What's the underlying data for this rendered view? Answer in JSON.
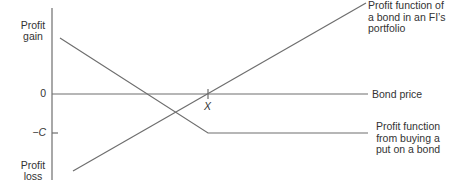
{
  "diagram": {
    "type": "payoff-diagram",
    "y_axis": {
      "top_label_line1": "Profit",
      "top_label_line2": "gain",
      "bottom_label_line1": "Profit",
      "bottom_label_line2": "loss",
      "ticks": [
        {
          "label": "0",
          "position": "origin"
        },
        {
          "label": "−C",
          "position": "put premium"
        }
      ]
    },
    "x_axis": {
      "label": "Bond price",
      "tick_label": "X"
    },
    "lines": [
      {
        "name": "bond-profit",
        "label_line1": "Profit function of",
        "label_line2": "a bond in an FI’s",
        "label_line3": "portfolio",
        "shape": "upward sloping straight line"
      },
      {
        "name": "put-profit",
        "label_line1": "Profit function",
        "label_line2": "from buying a",
        "label_line3": "put on a bond",
        "shape": "downward slope until X, then flat at -C"
      }
    ],
    "colors": {
      "line": "#6e6e6e",
      "text": "#333333",
      "background": "#ffffff"
    }
  }
}
